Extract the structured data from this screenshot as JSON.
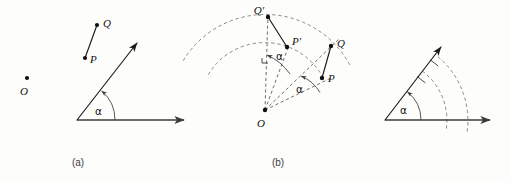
{
  "figure": {
    "background_color": "#fdfdfc",
    "stroke_color": "#111111",
    "dash_color": "#777777",
    "width": 510,
    "height": 182
  },
  "panels": [
    {
      "id": "a",
      "caption": "(a)",
      "caption_x": 78,
      "caption_y": 166,
      "points": [
        {
          "name": "O",
          "label": "O",
          "x": 27,
          "y": 78,
          "label_x": 24,
          "label_y": 95
        },
        {
          "name": "P",
          "label": "P",
          "x": 85,
          "y": 58,
          "label_x": 90,
          "label_y": 62
        },
        {
          "name": "Q",
          "label": "Q",
          "x": 97,
          "y": 25,
          "label_x": 103,
          "label_y": 26
        }
      ],
      "segments": [
        {
          "name": "vector-PQ",
          "from": "P",
          "to": "Q",
          "style": "solid",
          "arrow": false
        }
      ],
      "angle": {
        "label": "α",
        "label_x": 95,
        "label_y": 114,
        "vertex_x": 77,
        "vertex_y": 120,
        "arc_radius": 38,
        "degrees": 50
      },
      "rays": [
        {
          "name": "horizontal-axis-ray",
          "x1": 77,
          "y1": 120,
          "x2": 186,
          "y2": 120,
          "arrow": true
        },
        {
          "name": "rotated-axis-ray",
          "x1": 77,
          "y1": 120,
          "x2": 139,
          "y2": 41,
          "arrow": true
        }
      ],
      "arcs": []
    },
    {
      "id": "b",
      "caption": "(b)",
      "caption_x": 278,
      "caption_y": 166,
      "points": [
        {
          "name": "O",
          "label": "O",
          "x": 265,
          "y": 110,
          "label_x": 258,
          "label_y": 126
        },
        {
          "name": "P",
          "label": "P",
          "x": 322,
          "y": 78,
          "label_x": 328,
          "label_y": 82
        },
        {
          "name": "Q",
          "label": "Q",
          "x": 331,
          "y": 46,
          "label_x": 337,
          "label_y": 46
        },
        {
          "name": "P-prime",
          "label": "P′",
          "x": 287,
          "y": 47,
          "label_x": 292,
          "label_y": 44
        },
        {
          "name": "Q-prime",
          "label": "Q′",
          "x": 268,
          "y": 17,
          "label_x": 257,
          "label_y": 13
        }
      ],
      "segments": [
        {
          "name": "vector-PQ",
          "from": "P",
          "to": "Q",
          "style": "solid",
          "arrow": false
        },
        {
          "name": "vector-PQ-prime",
          "from": "P-prime",
          "to": "Q-prime",
          "style": "solid",
          "arrow": false
        },
        {
          "name": "radius-OP",
          "from": "O",
          "to": "P",
          "style": "dashed",
          "arrow": false
        },
        {
          "name": "radius-OQ",
          "from": "O",
          "to": "Q",
          "style": "dashed",
          "arrow": false
        },
        {
          "name": "radius-OP-prime",
          "from": "O",
          "to": "P-prime",
          "style": "dashed",
          "arrow": false
        },
        {
          "name": "radius-OQ-prime",
          "from": "O",
          "to": "Q-prime",
          "style": "dashed",
          "arrow": false
        }
      ],
      "angles": [
        {
          "name": "angle-alpha-lower",
          "label": "α",
          "label_x": 296,
          "label_y": 92,
          "radius": 40,
          "from_deg": 29,
          "to_deg": 60
        },
        {
          "name": "angle-alpha-upper",
          "label": "α",
          "label_x": 279,
          "label_y": 58,
          "subscript": "",
          "radius": 56,
          "from_deg": 63,
          "to_deg": 92
        }
      ],
      "arcs": [
        {
          "name": "dashed-arc-inner-PP",
          "radius": 66,
          "from_deg": 28,
          "to_deg": 150
        },
        {
          "name": "dashed-arc-outer-QQ",
          "radius": 96,
          "from_deg": 28,
          "to_deg": 152
        }
      ],
      "right_angle_marker": {
        "name": "right-angle-marker",
        "x": 266,
        "y": 57
      }
    },
    {
      "id": "c",
      "caption": "",
      "caption_x": 0,
      "caption_y": 0,
      "points": [],
      "segments": [],
      "angle": {
        "label": "α",
        "label_x": 403,
        "label_y": 113,
        "vertex_x": 385,
        "vertex_y": 120,
        "arc_radius": 36,
        "degrees": 52
      },
      "rays": [
        {
          "name": "horizontal-axis-ray",
          "x1": 385,
          "y1": 120,
          "x2": 492,
          "y2": 120,
          "arrow": true
        },
        {
          "name": "rotated-axis-ray",
          "x1": 385,
          "y1": 120,
          "x2": 443,
          "y2": 45,
          "arrow": true
        }
      ],
      "arcs": [
        {
          "name": "dashed-arc-inner",
          "radius": 62,
          "from_deg": -8,
          "to_deg": 60
        },
        {
          "name": "dashed-arc-outer",
          "radius": 83,
          "from_deg": -8,
          "to_deg": 60
        }
      ],
      "tick_marks": [
        {
          "name": "tick-inner",
          "radius": 62
        },
        {
          "name": "tick-outer",
          "radius": 83
        }
      ]
    }
  ]
}
